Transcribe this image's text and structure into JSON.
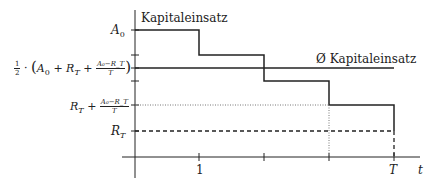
{
  "diagram": {
    "type": "step-function",
    "title_top": "Kapitaleinsatz",
    "average_label": "Ø Kapitaleinsatz",
    "y_labels": {
      "a0": {
        "base": "A",
        "sub": "0"
      },
      "average": {
        "prefix_num": "1",
        "prefix_den": "2",
        "dot": "·",
        "open": "(",
        "a": "A",
        "a_sub": "0",
        "plus1": "+",
        "r": "R",
        "r_sub": "T",
        "plus2": "+",
        "frac_num": "A₀−R_T",
        "frac_den": "T",
        "close": ")"
      },
      "rt_plus": {
        "r": "R",
        "r_sub": "T",
        "plus": "+",
        "frac_num": "A₀−R_T",
        "frac_den": "T"
      },
      "rt": {
        "base": "R",
        "sub": "T"
      }
    },
    "x_labels": {
      "one": "1",
      "T": "T",
      "t": "t"
    },
    "colors": {
      "line": "#222222",
      "dotted": "#777777"
    }
  }
}
